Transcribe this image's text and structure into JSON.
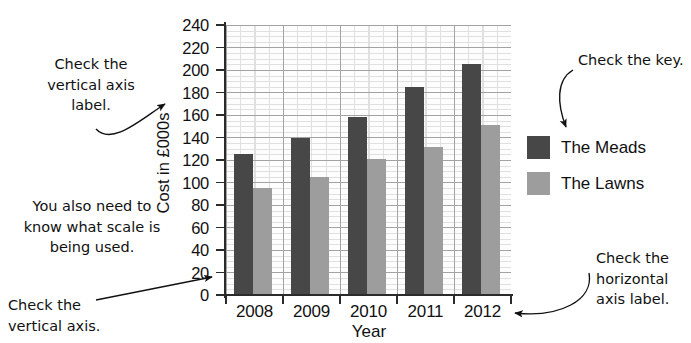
{
  "chart_data": {
    "type": "bar",
    "title": "",
    "categories": [
      "2008",
      "2009",
      "2010",
      "2011",
      "2012"
    ],
    "series": [
      {
        "name": "The Meads",
        "color": "#474747",
        "values": [
          125,
          140,
          158,
          185,
          205
        ]
      },
      {
        "name": "The Lawns",
        "color": "#9d9d9d",
        "values": [
          95,
          105,
          121,
          132,
          151
        ]
      }
    ],
    "xlabel": "Year",
    "ylabel": "Cost in £000s",
    "ylim": [
      0,
      240
    ],
    "ytick_step": 20,
    "yticks": [
      "240",
      "220",
      "200",
      "180",
      "160",
      "140",
      "120",
      "100",
      "80",
      "60",
      "40",
      "20",
      "0"
    ],
    "grid": true,
    "minor_grid": true,
    "legend_position": "right"
  },
  "legend": {
    "items": [
      {
        "label": "The Meads",
        "color": "#474747"
      },
      {
        "label": "The Lawns",
        "color": "#9d9d9d"
      }
    ]
  },
  "annotations": [
    {
      "id": "vertical-axis-label-note",
      "text": "Check the\nvertical axis\nlabel."
    },
    {
      "id": "scale-note",
      "text": "You also need to\nknow what scale is\nbeing used."
    },
    {
      "id": "vertical-axis-note",
      "text": "Check the\nvertical axis."
    },
    {
      "id": "key-note",
      "text": "Check the key."
    },
    {
      "id": "horizontal-axis-label-note",
      "text": "Check the\nhorizontal\naxis label."
    }
  ]
}
